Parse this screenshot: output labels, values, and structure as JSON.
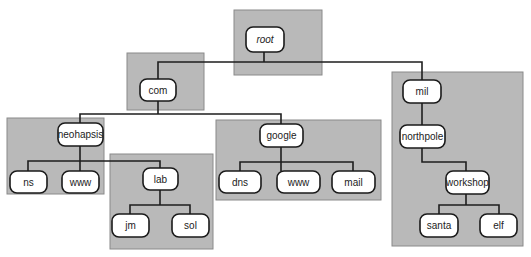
{
  "diagram": {
    "zone_fill": "#b9b9b9",
    "node_fill": "#ffffff",
    "line_color": "#1e1e1e",
    "nodes": {
      "root": "root",
      "com": "com",
      "mil": "mil",
      "neohapsis": "neohapsis",
      "google": "google",
      "ns": "ns",
      "www_neohapsis": "www",
      "lab": "lab",
      "jm": "jm",
      "sol": "sol",
      "dns": "dns",
      "www_google": "www",
      "mail": "mail",
      "northpole": "northpole",
      "workshop": "workshop",
      "santa": "santa",
      "elf": "elf"
    },
    "edges": [
      [
        "root",
        "com"
      ],
      [
        "root",
        "mil"
      ],
      [
        "com",
        "neohapsis"
      ],
      [
        "com",
        "google"
      ],
      [
        "neohapsis",
        "ns"
      ],
      [
        "neohapsis",
        "www_neohapsis"
      ],
      [
        "neohapsis",
        "lab"
      ],
      [
        "lab",
        "jm"
      ],
      [
        "lab",
        "sol"
      ],
      [
        "google",
        "dns"
      ],
      [
        "google",
        "www_google"
      ],
      [
        "google",
        "mail"
      ],
      [
        "mil",
        "northpole"
      ],
      [
        "northpole",
        "workshop"
      ],
      [
        "workshop",
        "santa"
      ],
      [
        "workshop",
        "elf"
      ]
    ],
    "zones": [
      {
        "name": "root-zone",
        "members": [
          "root"
        ]
      },
      {
        "name": "com-zone",
        "members": [
          "com"
        ]
      },
      {
        "name": "mil-zone",
        "members": [
          "mil",
          "northpole",
          "workshop",
          "santa",
          "elf"
        ]
      },
      {
        "name": "neohapsis-zone",
        "members": [
          "neohapsis",
          "ns",
          "www_neohapsis"
        ]
      },
      {
        "name": "lab-zone",
        "members": [
          "lab",
          "jm",
          "sol"
        ]
      },
      {
        "name": "google-zone",
        "members": [
          "google",
          "dns",
          "www_google",
          "mail"
        ]
      }
    ]
  }
}
